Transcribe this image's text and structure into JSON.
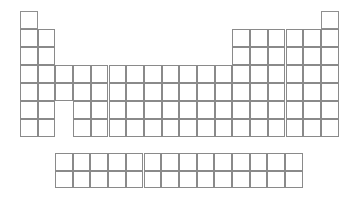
{
  "document": {
    "title": "Blank Periodic Table Worksheet",
    "kind": "periodic-table-template",
    "background_color": "#ffffff",
    "line_color": "#7d7d7d",
    "width": 355,
    "height": 198
  },
  "layout": {
    "origin_x": 20,
    "origin_y": 11,
    "cell_width": 17.7,
    "cell_height": 18.0,
    "columns": 18,
    "periods": 7,
    "fblock": {
      "origin_x": 55,
      "origin_y": 153,
      "columns": 14,
      "rows": 2,
      "cell_width": 17.7,
      "cell_height": 17.5
    }
  },
  "grid": {
    "note": "Each entry is a contiguous run of empty cells: [period_row_index, start_column, end_column]",
    "main_rows": [
      {
        "row": 1,
        "runs": [
          [
            1,
            1
          ],
          [
            18,
            18
          ]
        ]
      },
      {
        "row": 2,
        "runs": [
          [
            1,
            2
          ],
          [
            13,
            18
          ]
        ]
      },
      {
        "row": 3,
        "runs": [
          [
            1,
            2
          ],
          [
            13,
            18
          ]
        ]
      },
      {
        "row": 4,
        "runs": [
          [
            1,
            18
          ]
        ]
      },
      {
        "row": 5,
        "runs": [
          [
            1,
            18
          ]
        ]
      },
      {
        "row": 6,
        "runs": [
          [
            1,
            2
          ],
          [
            4,
            18
          ]
        ]
      },
      {
        "row": 7,
        "runs": [
          [
            1,
            2
          ],
          [
            4,
            18
          ]
        ]
      }
    ],
    "fblock_rows": [
      {
        "row": 1,
        "runs": [
          [
            1,
            14
          ]
        ]
      },
      {
        "row": 2,
        "runs": [
          [
            1,
            14
          ]
        ]
      }
    ]
  },
  "cells": {
    "total_main": 104,
    "total_fblock": 28,
    "all_blank": true,
    "text": ""
  }
}
